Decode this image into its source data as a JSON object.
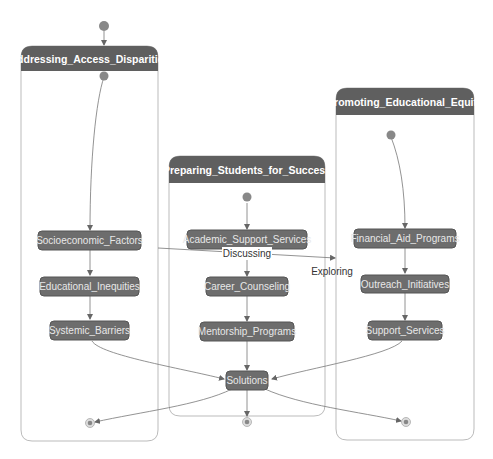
{
  "diagram": {
    "type": "state-diagram",
    "colors": {
      "header_fill": "#5f5f5f",
      "node_fill": "#6d6d6d",
      "node_stroke": "#555555",
      "node_text": "#e8e8e8",
      "container_stroke": "#bbbbbb",
      "edge": "#777777",
      "start_dot": "#888888"
    },
    "clusters": [
      {
        "id": "c1",
        "title": "Addressing_Access_Disparities"
      },
      {
        "id": "c2",
        "title": "Preparing_Students_for_Success"
      },
      {
        "id": "c3",
        "title": "Promoting_Educational_Equity"
      }
    ],
    "nodes": {
      "socioeconomic": "Socioeconomic_Factors",
      "educational_inequities": "Educational_Inequities",
      "systemic_barriers": "Systemic_Barriers",
      "academic_support": "Academic_Support_Services",
      "career_counseling": "Career_Counseling",
      "mentorship": "Mentorship_Programs",
      "solutions": "Solutions",
      "financial_aid": "Financial_Aid_Programs",
      "outreach": "Outreach_Initiatives",
      "support_services": "Support_Services"
    },
    "edge_labels": {
      "discussing": "Discussing",
      "exploring": "Exploring"
    },
    "edges": [
      {
        "from": "start",
        "to": "Addressing_Access_Disparities"
      },
      {
        "from": "c1_start",
        "to": "Socioeconomic_Factors"
      },
      {
        "from": "Socioeconomic_Factors",
        "to": "Educational_Inequities"
      },
      {
        "from": "Educational_Inequities",
        "to": "Systemic_Barriers"
      },
      {
        "from": "Systemic_Barriers",
        "to": "Solutions"
      },
      {
        "from": "c2_start",
        "to": "Academic_Support_Services"
      },
      {
        "from": "Academic_Support_Services",
        "to": "Career_Counseling"
      },
      {
        "from": "Career_Counseling",
        "to": "Mentorship_Programs"
      },
      {
        "from": "Mentorship_Programs",
        "to": "Solutions"
      },
      {
        "from": "c3_start",
        "to": "Financial_Aid_Programs"
      },
      {
        "from": "Financial_Aid_Programs",
        "to": "Outreach_Initiatives"
      },
      {
        "from": "Outreach_Initiatives",
        "to": "Support_Services"
      },
      {
        "from": "Support_Services",
        "to": "Solutions"
      },
      {
        "from": "Socioeconomic_Factors",
        "to": "Promoting_Educational_Equity",
        "label": "Discussing"
      },
      {
        "from": "Socioeconomic_Factors",
        "to": "Promoting_Educational_Equity",
        "label": "Exploring"
      },
      {
        "from": "Solutions",
        "to": "end_left"
      },
      {
        "from": "Solutions",
        "to": "end_center"
      },
      {
        "from": "Solutions",
        "to": "end_right"
      }
    ]
  }
}
